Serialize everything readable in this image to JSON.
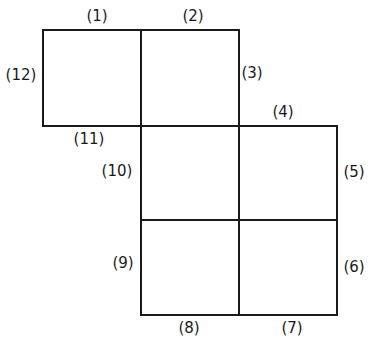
{
  "diagram": {
    "type": "net of squares with numbered edges",
    "line_color": "#1a1a1a",
    "labels": [
      {
        "id": "1",
        "text": "(1)",
        "x": 97,
        "y": 16
      },
      {
        "id": "2",
        "text": "(2)",
        "x": 193,
        "y": 16
      },
      {
        "id": "3",
        "text": "(3)",
        "x": 252,
        "y": 73
      },
      {
        "id": "4",
        "text": "(4)",
        "x": 283,
        "y": 112
      },
      {
        "id": "5",
        "text": "(5)",
        "x": 354,
        "y": 172
      },
      {
        "id": "6",
        "text": "(6)",
        "x": 354,
        "y": 267
      },
      {
        "id": "7",
        "text": "(7)",
        "x": 292,
        "y": 328
      },
      {
        "id": "8",
        "text": "(8)",
        "x": 189,
        "y": 328
      },
      {
        "id": "9",
        "text": "(9)",
        "x": 123,
        "y": 263
      },
      {
        "id": "10",
        "text": "(10)",
        "x": 117,
        "y": 171
      },
      {
        "id": "11",
        "text": "(11)",
        "x": 89,
        "y": 139
      },
      {
        "id": "12",
        "text": "(12)",
        "x": 21,
        "y": 75
      }
    ]
  }
}
